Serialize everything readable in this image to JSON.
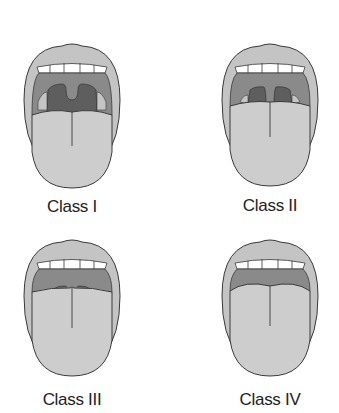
{
  "diagram": {
    "title": "",
    "colors": {
      "lips": "#c4c4c4",
      "tongue": "#cdcdcd",
      "palate": "#8a8a8a",
      "pharynx": "#5e5e5e",
      "teeth": "#ffffff",
      "outline": "#3a3a3a"
    },
    "panels": [
      {
        "id": "class-1",
        "label": "Class I"
      },
      {
        "id": "class-2",
        "label": "Class II"
      },
      {
        "id": "class-3",
        "label": "Class III"
      },
      {
        "id": "class-4",
        "label": "Class IV"
      }
    ]
  }
}
